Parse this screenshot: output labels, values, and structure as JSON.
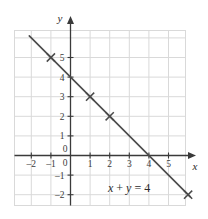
{
  "figure": {
    "title": "",
    "background_color": "#ffffff",
    "grid_color": "#d9d9d9",
    "axis_color": "#3a3a3a",
    "line_color": "#4a4a4a",
    "text_color": "#2b2b2b"
  },
  "labels": {
    "x_axis_name": "x",
    "y_axis_name": "y",
    "equation_x": "x",
    "equation_plus": " + ",
    "equation_y": "y",
    "equation_equals": " = ",
    "equation_value": "4",
    "equation_full": "x + y = 4"
  },
  "chart_data": {
    "type": "line",
    "title": "",
    "xlabel": "x",
    "ylabel": "y",
    "equation": "x + y = 4",
    "grid": true,
    "legend": "none",
    "xlim": [
      -2.8,
      6.0
    ],
    "ylim": [
      -2.7,
      6.0
    ],
    "xticks": [
      -2,
      -1,
      0,
      1,
      2,
      3,
      4,
      5
    ],
    "xtick_labels": [
      "-2",
      "-1",
      "0",
      "1",
      "2",
      "3",
      "4",
      "5"
    ],
    "yticks": [
      -2,
      -1,
      0,
      1,
      2,
      3,
      4,
      5
    ],
    "ytick_labels": [
      "-2",
      "-1",
      "0",
      "1",
      "2",
      "3",
      "4",
      "5"
    ],
    "series": [
      {
        "name": "x + y = 4",
        "kind": "line",
        "slope": -1,
        "intercept": 4,
        "x_intercept": 4,
        "y_intercept": 4,
        "endpoints": [
          [
            -2.1,
            6.1
          ],
          [
            6.1,
            -2.1
          ]
        ],
        "marker": "x",
        "points": [
          {
            "x": -1,
            "y": 5
          },
          {
            "x": 1,
            "y": 3
          },
          {
            "x": 2,
            "y": 2
          },
          {
            "x": 6,
            "y": -2
          }
        ]
      }
    ]
  }
}
